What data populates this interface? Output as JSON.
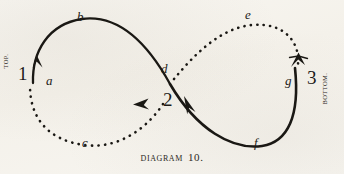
{
  "figure": {
    "caption_word": "Diagram",
    "caption_number": "10.",
    "side_labels": {
      "left": "TOP.",
      "right": "BOTTOM."
    },
    "nodes": [
      {
        "id": "n1",
        "label": "1",
        "kind": "number",
        "x": 22,
        "y": 74
      },
      {
        "id": "n2",
        "label": "2",
        "kind": "number",
        "x": 168,
        "y": 100
      },
      {
        "id": "n3",
        "label": "3",
        "kind": "number",
        "x": 312,
        "y": 78
      }
    ],
    "points": [
      {
        "id": "pa",
        "label": "a",
        "x": 49,
        "y": 80,
        "on": "solid-left-ascending"
      },
      {
        "id": "pb",
        "label": "b",
        "x": 80,
        "y": 18,
        "on": "solid-left-top"
      },
      {
        "id": "pc",
        "label": "c",
        "x": 85,
        "y": 143,
        "on": "dotted-left-bottom"
      },
      {
        "id": "pd",
        "label": "d",
        "x": 164,
        "y": 70,
        "on": "crossing-upper"
      },
      {
        "id": "pe",
        "label": "e",
        "x": 248,
        "y": 16,
        "on": "dotted-right-top"
      },
      {
        "id": "pf",
        "label": "f",
        "x": 257,
        "y": 143,
        "on": "solid-right-bottom"
      },
      {
        "id": "pg",
        "label": "g",
        "x": 288,
        "y": 82,
        "on": "solid-right-ascending"
      }
    ],
    "strokes": {
      "solid_color": "#1a1814",
      "dotted_color": "#1a1814",
      "paper_color": "#f6f4ef"
    },
    "arrows": [
      {
        "id": "arrow-up-left",
        "direction": "up",
        "x": 38,
        "y": 56
      },
      {
        "id": "arrow-left-mid",
        "direction": "left",
        "x": 140,
        "y": 103
      },
      {
        "id": "arrow-down-mid",
        "direction": "down",
        "x": 191,
        "y": 107
      },
      {
        "id": "arrow-up-right",
        "direction": "up",
        "x": 297,
        "y": 57
      }
    ],
    "paths": {
      "solid_left": "M 32,84 C 32,52 48,24 82,19 C 120,14 148,44 169,83",
      "solid_right": "M 169,83 C 196,129 232,150 262,146 C 288,142 300,118 296,70",
      "dotted_left": "M 30,86 C 30,118 48,140 84,145 C 122,150 148,126 163,104",
      "dotted_right": "M 172,80 C 192,56 218,28 252,25 C 284,22 300,44 298,66"
    }
  }
}
